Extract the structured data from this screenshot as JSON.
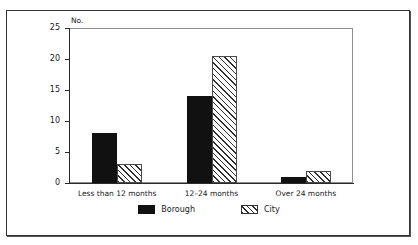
{
  "caption_ghost": "",
  "chart_data": {
    "type": "bar",
    "title": "",
    "xlabel": "",
    "ylabel": "No.",
    "ylim": [
      0,
      25
    ],
    "yticks": [
      0,
      5,
      10,
      15,
      20,
      25
    ],
    "grid": false,
    "legend_position": "bottom-center",
    "categories": [
      "Less than 12 months",
      "12–24 months",
      "Over 24 months"
    ],
    "series": [
      {
        "name": "Borough",
        "pattern": "solid-black",
        "color": "#111111",
        "values": [
          8,
          14,
          1
        ]
      },
      {
        "name": "City",
        "pattern": "diagonal-hatch",
        "color": "#2e2e2e",
        "values": [
          3,
          20.5,
          2
        ]
      }
    ]
  },
  "axis": {
    "y_title": "No.",
    "y_tick_labels": [
      "0",
      "5",
      "10",
      "15",
      "20",
      "25"
    ]
  },
  "x_categories": [
    {
      "label": "Less than 12 months"
    },
    {
      "label": "12–24 months"
    },
    {
      "label": "Over 24 months"
    }
  ],
  "legend": {
    "items": [
      {
        "label": "Borough",
        "pattern": "solid-black"
      },
      {
        "label": "City",
        "pattern": "diagonal-hatch"
      }
    ]
  }
}
